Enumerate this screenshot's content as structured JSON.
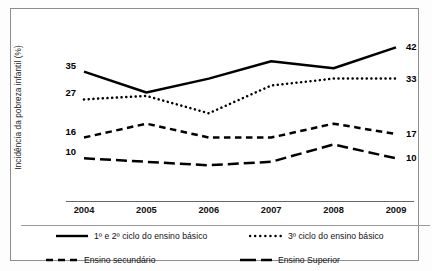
{
  "chart_data": {
    "type": "line",
    "title": "",
    "xlabel": "",
    "ylabel": "Incidência da pobreza infantil (%)",
    "categories": [
      "2004",
      "2005",
      "2006",
      "2007",
      "2008",
      "2009"
    ],
    "x": [
      2004,
      2005,
      2006,
      2007,
      2008,
      2009
    ],
    "ylim": [
      0,
      45
    ],
    "grid": false,
    "legend_position": "bottom",
    "series": [
      {
        "name": "1º e 2º ciclo do ensino básico",
        "style": "solid",
        "values": [
          35,
          29,
          33,
          38,
          36,
          42
        ],
        "start_label": "35",
        "end_label": "42"
      },
      {
        "name": "3º ciclo do ensino básico",
        "style": "dotted",
        "values": [
          27,
          28,
          23,
          31,
          33,
          33
        ],
        "start_label": "27",
        "end_label": "33"
      },
      {
        "name": "Ensino secundário",
        "style": "dashed",
        "values": [
          16,
          20,
          16,
          16,
          20,
          17
        ],
        "start_label": "16",
        "end_label": "17"
      },
      {
        "name": "Ensino Superior",
        "style": "long-dashed",
        "values": [
          10,
          9,
          8,
          9,
          14,
          10
        ],
        "start_label": "10",
        "end_label": "10"
      }
    ],
    "endpoint_labels": {
      "left": [
        "35",
        "27",
        "16",
        "10"
      ],
      "right": [
        "42",
        "33",
        "17",
        "10"
      ]
    },
    "colors": {
      "line": "#000000",
      "axis": "#666666",
      "frame": "#8d8d8d",
      "text": "#111111",
      "background": "#ffffff"
    }
  },
  "axis": {
    "y_title": "Incidência da pobreza infantil (%)",
    "x_tick_labels": [
      "2004",
      "2005",
      "2006",
      "2007",
      "2008",
      "2009"
    ]
  },
  "legend": {
    "items": [
      {
        "label": "1º e 2º ciclo do ensino básico",
        "style": "solid"
      },
      {
        "label": "3º ciclo do ensino básico",
        "style": "dotted"
      },
      {
        "label": "Ensino secundário",
        "style": "dashed"
      },
      {
        "label": "Ensino Superior",
        "style": "long-dashed"
      }
    ]
  }
}
